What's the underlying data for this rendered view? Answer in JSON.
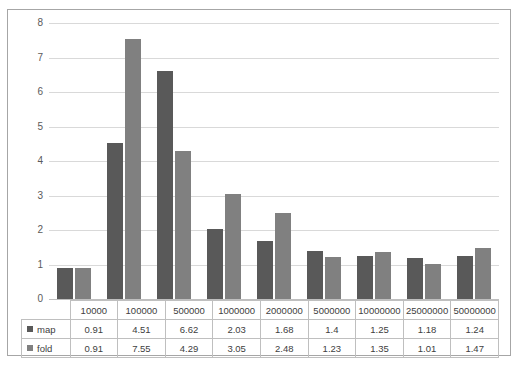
{
  "chart_data": {
    "type": "bar",
    "title": "",
    "xlabel": "",
    "ylabel": "",
    "ylim": [
      0,
      8
    ],
    "yticks": [
      8,
      7,
      6,
      5,
      4,
      3,
      2,
      1,
      0
    ],
    "grid": true,
    "legend_position": "data-table",
    "categories": [
      "10000",
      "100000",
      "500000",
      "1000000",
      "2000000",
      "5000000",
      "10000000",
      "25000000",
      "50000000"
    ],
    "series": [
      {
        "name": "map",
        "color": "#595959",
        "values": [
          0.91,
          4.51,
          6.62,
          2.03,
          1.68,
          1.4,
          1.25,
          1.18,
          1.24
        ],
        "labels": [
          "0.91",
          "4.51",
          "6.62",
          "2.03",
          "1.68",
          "1.4",
          "1.25",
          "1.18",
          "1.24"
        ]
      },
      {
        "name": "fold",
        "color": "#808080",
        "values": [
          0.91,
          7.55,
          4.29,
          3.05,
          2.48,
          1.23,
          1.35,
          1.01,
          1.47
        ],
        "labels": [
          "0.91",
          "7.55",
          "4.29",
          "3.05",
          "2.48",
          "1.23",
          "1.35",
          "1.01",
          "1.47"
        ]
      }
    ]
  },
  "colors": {
    "series_map": "#595959",
    "series_fold": "#808080",
    "gridline": "#d9d9d9",
    "axis": "#bfbfbf",
    "frame": "#a6a6a6",
    "table_border": "#bfbfbf",
    "text": "#404040",
    "background": "#ffffff"
  }
}
